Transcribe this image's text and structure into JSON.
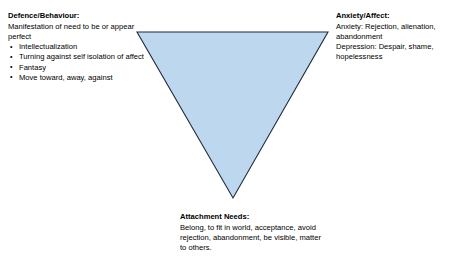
{
  "diagram": {
    "shape": {
      "name": "inverted-triangle",
      "fill_color": "#bdd7ee",
      "stroke_color": "#1f2a3c",
      "points": "137,32 328,32 233,198"
    },
    "blocks": {
      "defence": {
        "heading": "Defence/Behaviour:",
        "paragraph": "Manifestation of need to be or appear perfect",
        "bullets": [
          "Intellectualization",
          "Turning against self isolation of affect",
          "Fantasy",
          "Move toward, away, against"
        ]
      },
      "anxiety": {
        "heading": "Anxiety/Affect:",
        "line1": "Anxiety: Rejection, alienation, abandonment",
        "line2": "Depression: Despair, shame, hopelessness"
      },
      "attachment": {
        "heading": "Attachment Needs:",
        "paragraph": "Belong, to fit in world, acceptance, avoid rejection, abandonment, be visible, matter to others."
      }
    }
  }
}
